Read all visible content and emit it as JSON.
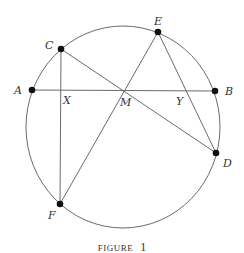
{
  "figure": {
    "caption_word": "FIGURE",
    "caption_number": "1",
    "colors": {
      "stroke": "#6b6b6b",
      "point": "#111111",
      "text": "#333333"
    },
    "circle": {
      "cx": 123,
      "cy": 127,
      "rx": 97,
      "ry": 101
    },
    "points": {
      "A": {
        "label": "A",
        "x": 32,
        "y": 90
      },
      "B": {
        "label": "B",
        "x": 215,
        "y": 91
      },
      "C": {
        "label": "C",
        "x": 61,
        "y": 49
      },
      "D": {
        "label": "D",
        "x": 216,
        "y": 153
      },
      "E": {
        "label": "E",
        "x": 158,
        "y": 32
      },
      "F": {
        "label": "F",
        "x": 60,
        "y": 204
      }
    },
    "intersections": {
      "M": {
        "label": "M",
        "x": 124,
        "y": 90
      },
      "X": {
        "label": "X",
        "x": 61,
        "y": 90
      },
      "Y": {
        "label": "Y",
        "x": 184,
        "y": 91
      }
    },
    "segments": [
      [
        "A",
        "B"
      ],
      [
        "C",
        "F"
      ],
      [
        "C",
        "D"
      ],
      [
        "E",
        "F"
      ],
      [
        "E",
        "D"
      ]
    ]
  }
}
